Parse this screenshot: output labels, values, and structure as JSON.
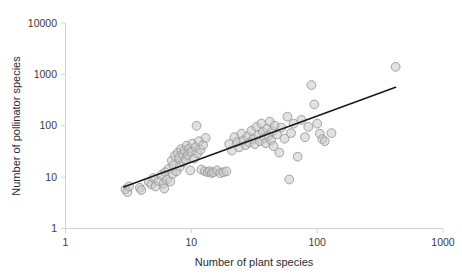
{
  "chart_data": {
    "type": "scatter",
    "title": "",
    "xlabel": "Number of plant species",
    "ylabel": "Number of pollinator species",
    "xscale": "log",
    "yscale": "log",
    "xlim": [
      1,
      1000
    ],
    "ylim": [
      1,
      10000
    ],
    "xticks": [
      1,
      10,
      100,
      1000
    ],
    "xtick_labels": [
      "1",
      "10",
      "100",
      "1000"
    ],
    "yticks": [
      1,
      10,
      100,
      1000,
      10000
    ],
    "ytick_labels": [
      "1",
      "10",
      "100",
      "1000",
      "10000"
    ],
    "grid": false,
    "legend": "none",
    "marker_style": "open-circle-grey",
    "series": [
      {
        "name": "plant-pollinator networks",
        "points": [
          [
            3.0,
            5.8
          ],
          [
            3.1,
            5.1
          ],
          [
            3.2,
            6.6
          ],
          [
            3.9,
            6.2
          ],
          [
            4.0,
            5.6
          ],
          [
            4.6,
            8.0
          ],
          [
            4.8,
            7.2
          ],
          [
            5.0,
            9.6
          ],
          [
            5.2,
            6.6
          ],
          [
            5.5,
            8.4
          ],
          [
            5.8,
            11.0
          ],
          [
            6.0,
            7.4
          ],
          [
            6.1,
            6.0
          ],
          [
            6.2,
            12.5
          ],
          [
            6.4,
            9.0
          ],
          [
            6.6,
            14.5
          ],
          [
            6.8,
            8.2
          ],
          [
            7.0,
            21.0
          ],
          [
            7.1,
            11.5
          ],
          [
            7.2,
            17.0
          ],
          [
            7.4,
            26.0
          ],
          [
            7.6,
            13.0
          ],
          [
            7.8,
            30.0
          ],
          [
            8.0,
            24.0
          ],
          [
            8.1,
            16.0
          ],
          [
            8.3,
            35.0
          ],
          [
            8.5,
            28.0
          ],
          [
            8.6,
            19.5
          ],
          [
            8.8,
            33.0
          ],
          [
            9.0,
            22.0
          ],
          [
            9.2,
            41.0
          ],
          [
            9.4,
            27.0
          ],
          [
            9.6,
            36.0
          ],
          [
            9.8,
            13.5
          ],
          [
            10.0,
            31.0
          ],
          [
            10.2,
            45.0
          ],
          [
            10.5,
            23.0
          ],
          [
            10.8,
            38.0
          ],
          [
            11.0,
            100.0
          ],
          [
            11.2,
            29.0
          ],
          [
            11.5,
            50.0
          ],
          [
            11.8,
            34.0
          ],
          [
            12.0,
            14.0
          ],
          [
            12.4,
            42.0
          ],
          [
            12.8,
            13.0
          ],
          [
            13.0,
            58.0
          ],
          [
            13.5,
            12.5
          ],
          [
            14.0,
            13.0
          ],
          [
            14.5,
            12.0
          ],
          [
            15.0,
            12.5
          ],
          [
            16.0,
            13.5
          ],
          [
            17.0,
            12.0
          ],
          [
            18.0,
            12.5
          ],
          [
            19.0,
            13.0
          ],
          [
            20.0,
            44.0
          ],
          [
            21.0,
            33.0
          ],
          [
            22.0,
            60.0
          ],
          [
            23.0,
            48.0
          ],
          [
            24.0,
            38.0
          ],
          [
            25.0,
            70.0
          ],
          [
            26.0,
            52.0
          ],
          [
            27.0,
            42.0
          ],
          [
            28.0,
            62.0
          ],
          [
            29.0,
            47.0
          ],
          [
            30.0,
            80.0
          ],
          [
            31.0,
            55.0
          ],
          [
            32.0,
            44.0
          ],
          [
            33.0,
            95.0
          ],
          [
            34.0,
            66.0
          ],
          [
            35.0,
            50.0
          ],
          [
            36.0,
            110.0
          ],
          [
            37.0,
            75.0
          ],
          [
            38.0,
            58.0
          ],
          [
            39.0,
            46.0
          ],
          [
            40.0,
            88.0
          ],
          [
            41.0,
            64.0
          ],
          [
            42.0,
            120.0
          ],
          [
            43.0,
            52.0
          ],
          [
            44.0,
            78.0
          ],
          [
            45.0,
            40.0
          ],
          [
            46.0,
            100.0
          ],
          [
            48.0,
            68.0
          ],
          [
            50.0,
            30.0
          ],
          [
            52.0,
            92.0
          ],
          [
            55.0,
            56.0
          ],
          [
            58.0,
            150.0
          ],
          [
            60.0,
            9.0
          ],
          [
            62.0,
            72.0
          ],
          [
            65.0,
            110.0
          ],
          [
            70.0,
            25.0
          ],
          [
            75.0,
            130.0
          ],
          [
            80.0,
            60.0
          ],
          [
            85.0,
            95.0
          ],
          [
            90.0,
            620.0
          ],
          [
            95.0,
            260.0
          ],
          [
            100.0,
            110.0
          ],
          [
            105.0,
            70.0
          ],
          [
            110.0,
            55.0
          ],
          [
            115.0,
            50.0
          ],
          [
            130.0,
            72.0
          ],
          [
            420.0,
            1400.0
          ]
        ]
      }
    ],
    "trend_line": {
      "name": "regression line",
      "x_start": 2.9,
      "y_start": 6.4,
      "x_end": 420.0,
      "y_end": 560.0
    }
  }
}
